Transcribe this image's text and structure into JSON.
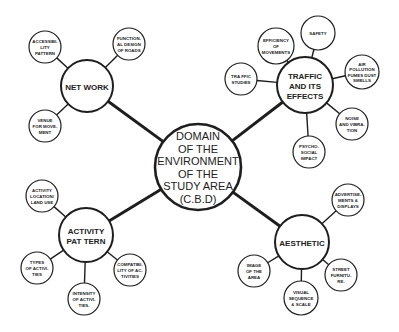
{
  "diagram": {
    "center": {
      "lines": [
        "DOMAIN",
        "OF THE",
        "ENVIRONMENT",
        "OF THE",
        "STUDY AREA",
        "(C.B.D)"
      ],
      "cx": 198,
      "cy": 167,
      "r": 43
    },
    "hubs": [
      {
        "id": "network",
        "lines": [
          "NET WORK"
        ],
        "cx": 87,
        "cy": 86,
        "r": 26,
        "children": [
          {
            "lines": [
              "ACCESSIBI-",
              "LITY",
              "PATTERN"
            ],
            "cx": 45,
            "cy": 47,
            "r": 16
          },
          {
            "lines": [
              "FUNCTION-",
              "AL DESIGN",
              "OF ROADS"
            ],
            "cx": 129,
            "cy": 44,
            "r": 16
          },
          {
            "lines": [
              "VENUE",
              "FOR MOVE-",
              "MENT"
            ],
            "cx": 45,
            "cy": 126,
            "r": 16
          }
        ]
      },
      {
        "id": "traffic",
        "lines": [
          "TRAFFIC",
          "AND ITS",
          "EFFECTS"
        ],
        "cx": 305,
        "cy": 85,
        "r": 28,
        "children": [
          {
            "lines": [
              "EFFICIENCY",
              "OF",
              "MOVEMENTS"
            ],
            "cx": 276,
            "cy": 46,
            "r": 18
          },
          {
            "lines": [
              "SAFETY"
            ],
            "cx": 318,
            "cy": 33,
            "r": 17
          },
          {
            "lines": [
              "AIR",
              "POLLUTION",
              "FUMES DUST",
              "SMELLS"
            ],
            "cx": 362,
            "cy": 72,
            "r": 17
          },
          {
            "lines": [
              "TRA FFIC",
              "STUDIES"
            ],
            "cx": 241,
            "cy": 79,
            "r": 16
          },
          {
            "lines": [
              "NOISE",
              "AND VIBRA-",
              "TION"
            ],
            "cx": 352,
            "cy": 124,
            "r": 16
          },
          {
            "lines": [
              "PSYCHO-",
              "SOCIAL",
              "IMPACT"
            ],
            "cx": 309,
            "cy": 152,
            "r": 16
          }
        ]
      },
      {
        "id": "activity",
        "lines": [
          "ACTIVITY",
          "PAT TERN"
        ],
        "cx": 86,
        "cy": 235,
        "r": 27,
        "children": [
          {
            "lines": [
              "ACTIVITY",
              "LOCATION/",
              "LAND USE"
            ],
            "cx": 42,
            "cy": 196,
            "r": 16
          },
          {
            "lines": [
              "TYPES",
              "OF ACTIVI-",
              "TIES"
            ],
            "cx": 37,
            "cy": 268,
            "r": 16
          },
          {
            "lines": [
              "INTENSITY",
              "OF ACTIVI-",
              "TIES."
            ],
            "cx": 84,
            "cy": 299,
            "r": 16
          },
          {
            "lines": [
              "COMPATIBI-",
              "LITY OF AC-",
              "TIVITIES"
            ],
            "cx": 130,
            "cy": 270,
            "r": 16
          }
        ]
      },
      {
        "id": "aesthetic",
        "lines": [
          "AESTHETIC"
        ],
        "cx": 302,
        "cy": 242,
        "r": 27,
        "children": [
          {
            "lines": [
              "ADVERTISE-",
              "MENTS &",
              "DISPLAYS"
            ],
            "cx": 348,
            "cy": 200,
            "r": 16
          },
          {
            "lines": [
              "IMAGE",
              "OF THE",
              "AREA"
            ],
            "cx": 254,
            "cy": 271,
            "r": 16
          },
          {
            "lines": [
              "VISUAL",
              "SEQUENCE",
              "& SCALE"
            ],
            "cx": 301,
            "cy": 298,
            "r": 17
          },
          {
            "lines": [
              "STREET",
              "FURNITU-",
              "RE."
            ],
            "cx": 341,
            "cy": 275,
            "r": 16
          }
        ]
      }
    ],
    "colors": {
      "stroke": "#1e1e1e",
      "fill": "#ffffff",
      "text": "#222222"
    }
  }
}
